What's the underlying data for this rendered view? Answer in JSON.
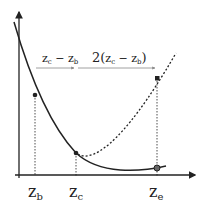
{
  "diagram": {
    "axis_labels": {
      "zb": "z",
      "zb_sub": "b",
      "zc": "z",
      "zc_sub": "c",
      "ze": "z",
      "ze_sub": "e"
    },
    "interval1": {
      "a": "z",
      "a_sub": "c",
      "minus": " − ",
      "b": "z",
      "b_sub": "b"
    },
    "interval2": {
      "prefix": "2(",
      "a": "z",
      "a_sub": "c",
      "minus": " − ",
      "b": "z",
      "b_sub": "b",
      "suffix": ")"
    },
    "colors": {
      "ink": "#222222",
      "grey": "#888888"
    }
  }
}
